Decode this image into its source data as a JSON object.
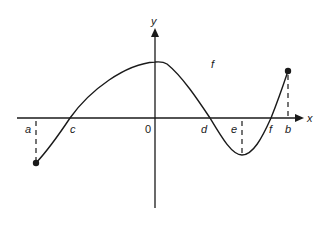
{
  "diagram": {
    "function_label": "f",
    "axes": {
      "x_label": "x",
      "y_label": "y",
      "origin_label": "0"
    },
    "points": [
      {
        "label": "a",
        "role": "left endpoint (closed dot below axis)"
      },
      {
        "label": "c",
        "role": "zero crossing"
      },
      {
        "label": "0",
        "role": "origin"
      },
      {
        "label": "d",
        "role": "zero crossing"
      },
      {
        "label": "e",
        "role": "local minimum x"
      },
      {
        "label": "f",
        "role": "zero crossing"
      },
      {
        "label": "b",
        "role": "right endpoint (closed dot above axis)"
      }
    ],
    "colors": {
      "stroke": "#1a1a1a",
      "background": "#ffffff"
    }
  },
  "labels": {
    "a": "a",
    "c": "c",
    "zero": "0",
    "d": "d",
    "e": "e",
    "f_root": "f",
    "b": "b",
    "x": "x",
    "y": "y",
    "f": "f"
  }
}
